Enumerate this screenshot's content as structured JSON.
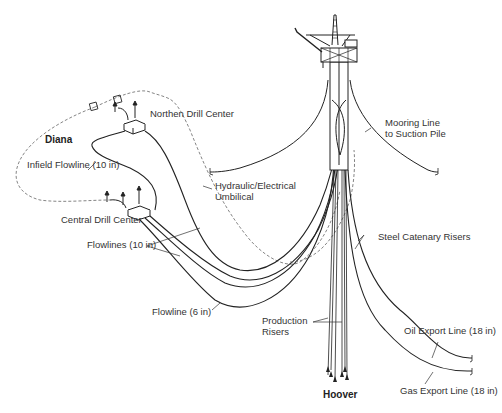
{
  "diagram": {
    "fields": {
      "diana": "Diana",
      "hoover": "Hoover"
    },
    "labels": {
      "northern_drill_center": "Northen Drill Center",
      "central_drill_center": "Central Drill Center",
      "infield_flowline": "Infield Flowline (10 in)",
      "flowlines": "Flowlines (10 in)",
      "flowline_6": "Flowline (6 in)",
      "umbilical_line1": "Hydraulic/Electrical",
      "umbilical_line2": "Umbilical",
      "mooring_line1": "Mooring Line",
      "mooring_line2": "to Suction Pile",
      "steel_catenary_risers": "Steel Catenary Risers",
      "production_risers_line1": "Production",
      "production_risers_line2": "Risers",
      "oil_export_line": "Oil Export Line  (18 in)",
      "gas_export_line": "Gas Export Line  (18 in)"
    },
    "colors": {
      "line": "#222222",
      "dashed": "#555555",
      "text": "#333333"
    }
  }
}
